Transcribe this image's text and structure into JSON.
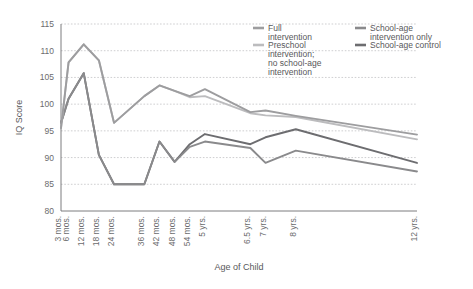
{
  "chart_data": {
    "type": "line",
    "title": "",
    "xlabel": "Age of Child",
    "ylabel": "IQ Score",
    "ylim": [
      80,
      115
    ],
    "yticks": [
      80,
      85,
      90,
      95,
      100,
      105,
      110,
      115
    ],
    "grid": true,
    "legend_position": "top-right",
    "categories": [
      "3 mos.",
      "6 mos.",
      "12 mos.",
      "18 mos.",
      "24 mos.",
      "36 mos.",
      "42 mos.",
      "48 mos.",
      "54 mos.",
      "5 yrs.",
      "6.5 yrs.",
      "7 yrs.",
      "8 yrs.",
      "12 yrs."
    ],
    "x_months": [
      3,
      6,
      12,
      18,
      24,
      36,
      42,
      48,
      54,
      60,
      78,
      84,
      96,
      144
    ],
    "series": [
      {
        "name": "Full intervention",
        "color": "#9d9d9f",
        "values": [
          95.5,
          107.8,
          111.2,
          108.2,
          96.5,
          101.5,
          103.5,
          102.5,
          101.5,
          102.8,
          98.5,
          98.8,
          97.8,
          94.3
        ]
      },
      {
        "name": "Preschool intervention; no school-age intervention",
        "color": "#bcbcbe",
        "values": [
          95.5,
          107.8,
          111.2,
          108.2,
          96.5,
          101.5,
          103.5,
          102.5,
          101.3,
          101.5,
          98.3,
          97.9,
          97.6,
          93.4
        ]
      },
      {
        "name": "School-age intervention only",
        "color": "#8a8a8c",
        "values": [
          96.5,
          101.0,
          105.8,
          90.5,
          85.0,
          85.0,
          93.0,
          89.2,
          92.0,
          93.0,
          91.8,
          89.0,
          91.3,
          87.4
        ]
      },
      {
        "name": "School-age control",
        "color": "#6d6d70",
        "values": [
          96.5,
          101.0,
          105.8,
          90.5,
          85.0,
          85.0,
          93.0,
          89.2,
          92.5,
          94.4,
          92.5,
          93.8,
          95.3,
          89.0
        ]
      }
    ]
  },
  "legend": {
    "items": [
      {
        "label_line1": "Full",
        "label_line2": "intervention",
        "label_line3": "",
        "label_line4": "",
        "color": "#9d9d9f"
      },
      {
        "label_line1": "Preschool",
        "label_line2": "intervention;",
        "label_line3": "no school-age",
        "label_line4": "intervention",
        "color": "#bcbcbe"
      },
      {
        "label_line1": "School-age",
        "label_line2": "intervention only",
        "label_line3": "",
        "label_line4": "",
        "color": "#8a8a8c"
      },
      {
        "label_line1": "School-age control",
        "label_line2": "",
        "label_line3": "",
        "label_line4": "",
        "color": "#6d6d70"
      }
    ]
  },
  "axes": {
    "y_title": "IQ Score",
    "x_title": "Age of Child"
  }
}
